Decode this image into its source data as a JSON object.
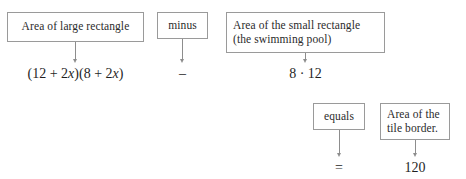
{
  "diagram": {
    "border_color": "#9a9a9a",
    "arrow_color": "#8d8d8d",
    "text_color": "#2b2b2b",
    "boxes": [
      {
        "id": "large-rectangle",
        "label": "Area of large rectangle",
        "align": "center"
      },
      {
        "id": "minus",
        "label": "minus",
        "align": "center"
      },
      {
        "id": "small-rectangle",
        "label": "Area of the small rectangle\n(the swimming pool)",
        "align": "left"
      },
      {
        "id": "equals",
        "label": "equals",
        "align": "center"
      },
      {
        "id": "tile-border",
        "label": "Area of the\ntile border.",
        "align": "left"
      }
    ],
    "expressions": [
      {
        "id": "large-rectangle-expression",
        "text": "(12 + 2x)(8 + 2x)",
        "parts": [
          {
            "t": "(12 + 2",
            "italic": false
          },
          {
            "t": "x",
            "italic": true
          },
          {
            "t": ")(8 + 2",
            "italic": false
          },
          {
            "t": "x",
            "italic": true
          },
          {
            "t": ")",
            "italic": false
          }
        ]
      },
      {
        "id": "minus-operator",
        "text": "–"
      },
      {
        "id": "small-rectangle-expression",
        "text": "8 · 12"
      },
      {
        "id": "equals-operator",
        "text": "="
      },
      {
        "id": "tile-border-value",
        "text": "120"
      }
    ]
  }
}
